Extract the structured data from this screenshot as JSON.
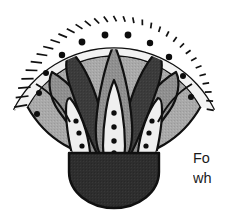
{
  "figure": {
    "name": "egyptian-lotus-palmette-ornament",
    "colors": {
      "outline": "#101010",
      "paper": "#ffffff",
      "fan_field": "#a9a9a9",
      "rim_band_fill": "#f2f2f2",
      "leaf_dark": "#3b3b3b",
      "leaf_mid": "#8f8f8f",
      "leaf_light": "#efefef",
      "base_dark": "#2e2e2e",
      "dot": "#0d0d0d",
      "text": "#1a1a1a"
    },
    "rim": {
      "band_count": 34,
      "label": "banded-rim"
    },
    "field_dots": {
      "count": 11,
      "label": "field-dot"
    },
    "leaves": [
      {
        "id": "outer-left-mid",
        "tone": "leaf_mid"
      },
      {
        "id": "outer-right-mid",
        "tone": "leaf_mid"
      },
      {
        "id": "inner-left-dark",
        "tone": "leaf_dark"
      },
      {
        "id": "inner-right-dark",
        "tone": "leaf_dark"
      },
      {
        "id": "center-mid",
        "tone": "leaf_mid"
      },
      {
        "id": "left-light-petal",
        "tone": "leaf_light",
        "dots": 3
      },
      {
        "id": "center-light-petal",
        "tone": "leaf_light",
        "dots": 4
      },
      {
        "id": "right-light-petal",
        "tone": "leaf_light",
        "dots": 3
      }
    ],
    "base": {
      "label": "rounded-dark-base"
    }
  },
  "body_text": {
    "line1": "Fo",
    "line2": "wh"
  }
}
